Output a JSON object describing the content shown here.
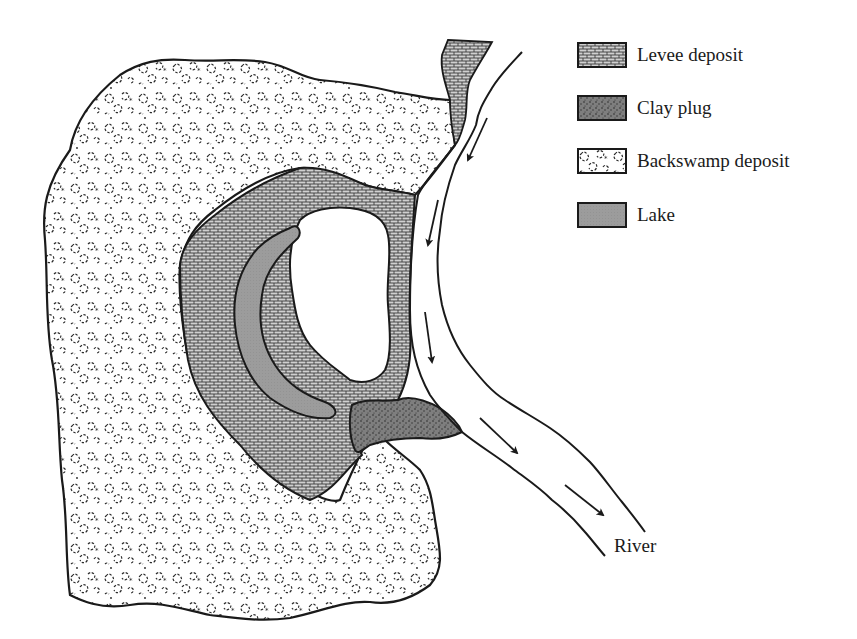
{
  "figure": {
    "type": "geologic-map-diagram"
  },
  "legend": {
    "items": [
      {
        "label": "Levee deposit",
        "pattern": "levee",
        "fill": "#b8b8b8"
      },
      {
        "label": "Clay plug",
        "pattern": "clay",
        "fill": "#6e6e6e"
      },
      {
        "label": "Backswamp deposit",
        "pattern": "backswamp",
        "fill": "#ffffff"
      },
      {
        "label": "Lake",
        "pattern": "lake",
        "fill": "#9a9a9a"
      }
    ]
  },
  "labels": {
    "river": "River"
  },
  "colors": {
    "outline": "#1a1a1a",
    "background": "#ffffff",
    "levee_base": "#c4c4c4",
    "clay": "#777777",
    "lake": "#9c9c9c"
  },
  "flow_arrows": {
    "count": 6,
    "direction": "downstream"
  }
}
